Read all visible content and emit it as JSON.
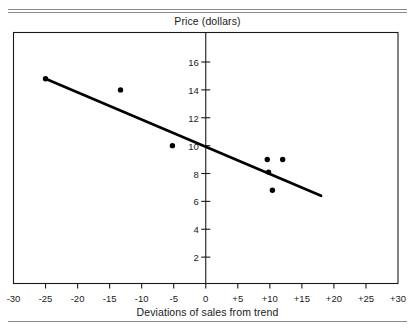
{
  "chart_data": {
    "type": "scatter",
    "title": "",
    "ylabel": "Price (dollars)",
    "xlabel": "Deviations of sales from trend",
    "xlim": [
      -30,
      30
    ],
    "ylim": [
      0,
      17
    ],
    "grid": false,
    "legend": "none",
    "x_ticks": [
      "-30",
      "-25",
      "-20",
      "-15",
      "-10",
      "-5",
      "0",
      "+5",
      "+10",
      "+15",
      "+20",
      "+25",
      "+30"
    ],
    "x_tick_values": [
      -30,
      -25,
      -20,
      -15,
      -10,
      -5,
      0,
      5,
      10,
      15,
      20,
      25,
      30
    ],
    "y_ticks": [
      "2",
      "4",
      "6",
      "8",
      "10",
      "12",
      "14",
      "16"
    ],
    "y_tick_values": [
      2,
      4,
      6,
      8,
      10,
      12,
      14,
      16
    ],
    "points": [
      {
        "x": -25.0,
        "y": 14.8
      },
      {
        "x": -13.3,
        "y": 14.0
      },
      {
        "x": -5.2,
        "y": 10.0
      },
      {
        "x": 9.6,
        "y": 9.0
      },
      {
        "x": 12.0,
        "y": 9.0
      },
      {
        "x": 9.8,
        "y": 8.1
      },
      {
        "x": 10.4,
        "y": 6.8
      }
    ],
    "series": [
      {
        "name": "observations",
        "type": "scatter",
        "x": [
          -25.0,
          -13.3,
          -5.2,
          9.6,
          12.0,
          9.8,
          10.4
        ],
        "values": [
          14.8,
          14.0,
          10.0,
          9.0,
          9.0,
          8.1,
          6.8
        ],
        "marker": "filled-circle",
        "color": "#000000"
      },
      {
        "name": "regression-line",
        "type": "line",
        "x": [
          -25.0,
          18.0
        ],
        "values": [
          14.8,
          6.4
        ],
        "color": "#000000",
        "width": 2.6
      }
    ],
    "axis_style": {
      "box": true,
      "vertical_axis_at_x": 0,
      "horizontal_axis_at_y": 0,
      "frame_color": "#1a1a1a",
      "axis_color": "#1a1a1a"
    }
  },
  "colors": {
    "background": "#ffffff",
    "ink": "#1a1a1a",
    "rule": "#8a8a8a",
    "marker": "#000000",
    "line": "#000000"
  }
}
